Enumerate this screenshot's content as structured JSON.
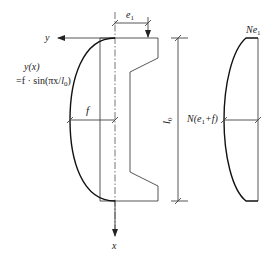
{
  "diagram": {
    "axes": {
      "x_label": "x",
      "y_label": "y"
    },
    "labels": {
      "eccentricity": "e",
      "eccentricity_sub": "1",
      "effective_length": "l",
      "effective_length_sub": "0",
      "deflection": "f",
      "deflection_func_line1": "y(x)",
      "deflection_func_line2_prefix": "=f · sin(πx/",
      "deflection_func_line2_l": "l",
      "deflection_func_line2_sub": "0",
      "deflection_func_line2_suffix": ")",
      "end_moment_N": "Ne",
      "end_moment_sub": "1",
      "mid_moment_prefix": "N(e",
      "mid_moment_sub": "1",
      "mid_moment_suffix": "+f)"
    }
  }
}
